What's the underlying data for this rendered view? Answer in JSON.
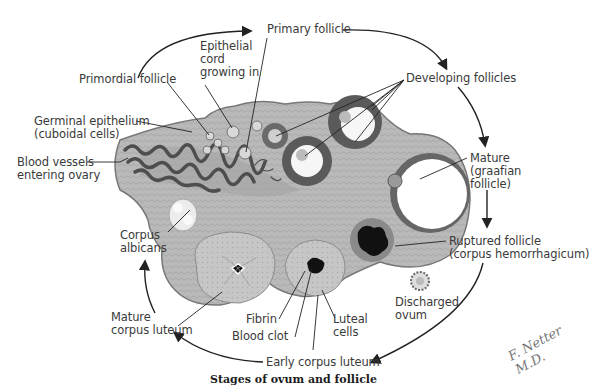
{
  "figure": {
    "caption": "Stages of ovum and follicle",
    "signature": "F. Netter M.D."
  },
  "labels": {
    "primary_follicle": "Primary follicle",
    "epithelial_cord": "Epithelial\ncord\ngrowing in",
    "primordial_follicle": "Primordial follicle",
    "developing_follicles": "Developing follicles",
    "germinal_epithelium": "Germinal epithelium\n(cuboidal cells)",
    "blood_vessels": "Blood vessels\nentering ovary",
    "mature_graafian": "Mature\n(graafian\nfollicle)",
    "corpus_albicans": "Corpus\nalbicans",
    "ruptured_follicle": "Ruptured follicle\n(corpus hemorrhagicum)",
    "mature_corpus_luteum": "Mature\ncorpus luteum",
    "discharged_ovum": "Discharged\novum",
    "fibrin": "Fibrin",
    "luteal_cells": "Luteal\ncells",
    "blood_clot": "Blood clot",
    "early_corpus_luteum": "Early corpus luteum"
  },
  "colors": {
    "stroma": "#b4b4b4",
    "stroma_dark": "#8e8e8e",
    "vessel": "#555555",
    "follicle_wall": "#5a5a5a",
    "clot": "#111111",
    "label_text": "#3a3a3a",
    "leader_line": "#222222"
  }
}
